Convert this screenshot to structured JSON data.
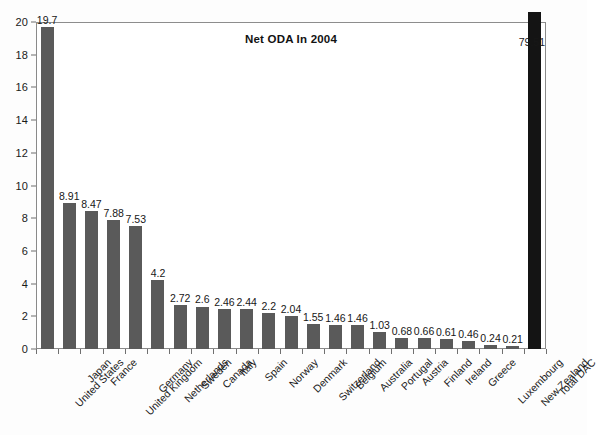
{
  "chart_data": {
    "type": "bar",
    "title": "Net ODA In 2004",
    "xlabel": "",
    "ylabel": "",
    "ylim": [
      0,
      20
    ],
    "ytick_step": 2,
    "yticks": [
      "0",
      "2",
      "4",
      "6",
      "8",
      "10",
      "12",
      "14",
      "16",
      "18",
      "20"
    ],
    "grid": false,
    "legend": "none",
    "categories": [
      "United States",
      "Japan",
      "France",
      "United Kingdom",
      "Germany",
      "Netherlands",
      "Sweden",
      "Canada",
      "Italy",
      "Spain",
      "Norway",
      "Denmark",
      "Switzerland",
      "Belgium",
      "Australia",
      "Portugal",
      "Austria",
      "Finland",
      "Ireland",
      "Greece",
      "Luxembourg",
      "New Zealand",
      "Total DAC"
    ],
    "values": [
      19.7,
      8.91,
      8.47,
      7.88,
      7.53,
      4.2,
      2.72,
      2.6,
      2.46,
      2.44,
      2.2,
      2.04,
      1.55,
      1.46,
      1.46,
      1.03,
      0.68,
      0.66,
      0.61,
      0.46,
      0.24,
      0.21,
      79.51
    ],
    "value_labels": [
      "19.7",
      "8.91",
      "8.47",
      "7.88",
      "7.53",
      "4.2",
      "2.72",
      "2.6",
      "2.46",
      "2.44",
      "2.2",
      "2.04",
      "1.55",
      "1.46",
      "1.46",
      "1.03",
      "0.68",
      "0.66",
      "0.61",
      "0.46",
      "0.24",
      "0.21",
      "79.51"
    ],
    "bar_colors": {
      "default": "#5a5a5a",
      "total": "#141414"
    }
  }
}
